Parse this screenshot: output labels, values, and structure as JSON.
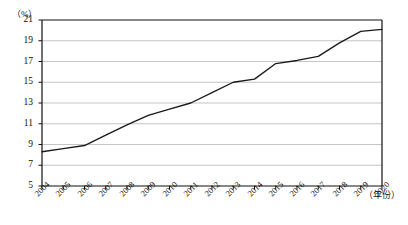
{
  "chart_data": {
    "type": "line",
    "title": "",
    "subtitle": "",
    "xlabel": "（年份）",
    "ylabel": "（%）",
    "ylim": [
      5,
      21
    ],
    "y_ticks": [
      5,
      7,
      9,
      11,
      13,
      15,
      17,
      19,
      21
    ],
    "grid": true,
    "legend": "none",
    "categories": [
      "2004",
      "2005",
      "2006",
      "2007",
      "2008",
      "2009",
      "2010",
      "2011",
      "2012",
      "2013",
      "2014",
      "2015",
      "2016",
      "2017",
      "2018",
      "2019",
      "2020"
    ],
    "values": [
      8.3,
      8.6,
      8.9,
      9.9,
      10.9,
      11.8,
      12.4,
      13.0,
      14.0,
      15.0,
      15.3,
      16.8,
      17.1,
      17.5,
      18.8,
      19.9,
      20.1
    ],
    "series": [
      {
        "name": "",
        "color": "#1a1a1a",
        "values": [
          8.3,
          8.6,
          8.9,
          9.9,
          10.9,
          11.8,
          12.4,
          13.0,
          14.0,
          15.0,
          15.3,
          16.8,
          17.1,
          17.5,
          18.8,
          19.9,
          20.1
        ]
      }
    ],
    "annotations": []
  },
  "axes": {
    "y_unit": "（%）",
    "x_unit": "（年份）"
  }
}
